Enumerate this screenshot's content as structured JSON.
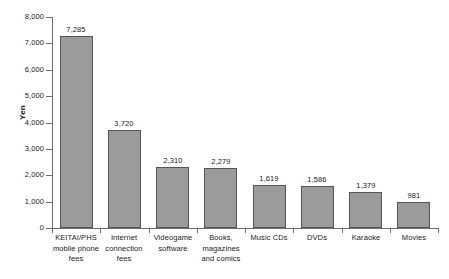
{
  "chart_data": {
    "type": "bar",
    "title": "",
    "xlabel": "",
    "ylabel": "Yen",
    "ylim": [
      0,
      8000
    ],
    "ytick_values": [
      0,
      1000,
      2000,
      3000,
      4000,
      5000,
      6000,
      7000,
      8000
    ],
    "ytick_labels": [
      "0",
      "1,000",
      "2,000",
      "3,000",
      "4,000",
      "5,000",
      "6,000",
      "7,000",
      "8,000"
    ],
    "grid": false,
    "legend": false,
    "bar_color": "#9b9b9b",
    "bar_edge_color": "#555555",
    "categories": [
      "KEITAI/PHS mobile phone fees",
      "Internet connection fees",
      "Videogame software",
      "Books, magazines and comics",
      "Music CDs",
      "DVDs",
      "Karaoke",
      "Movies"
    ],
    "category_lines": [
      [
        "KEITAI/PHS",
        "mobile phone",
        "fees"
      ],
      [
        "Internet",
        "connection",
        "fees"
      ],
      [
        "Videogame",
        "software"
      ],
      [
        "Books,",
        "magazines",
        "and comics"
      ],
      [
        "Music CDs"
      ],
      [
        "DVDs"
      ],
      [
        "Karaoke"
      ],
      [
        "Movies"
      ]
    ],
    "values": [
      7285,
      3720,
      2310,
      2279,
      1619,
      1586,
      1379,
      981
    ],
    "value_labels": [
      "7,285",
      "3,720",
      "2,310",
      "2,279",
      "1,619",
      "1,586",
      "1,379",
      "981"
    ]
  }
}
